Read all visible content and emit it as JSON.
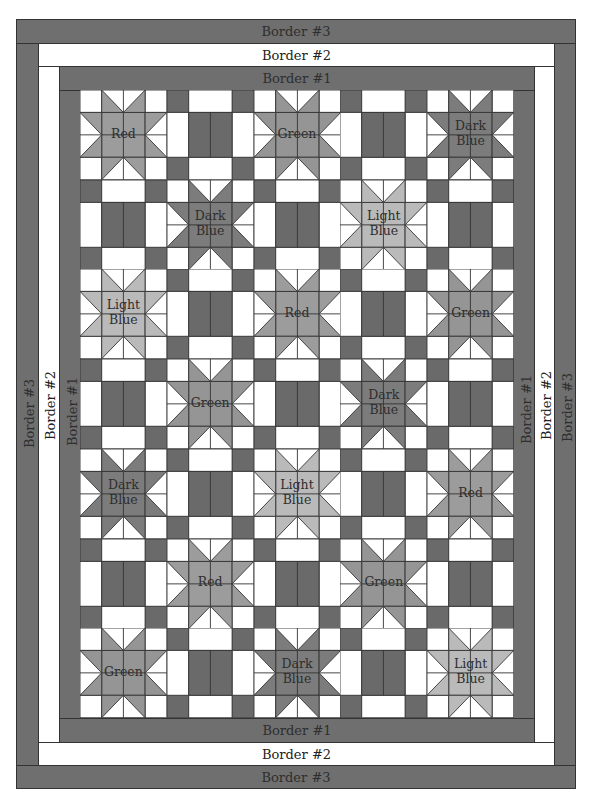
{
  "colors": {
    "border_dark": "#6f6f6f",
    "border_light": "#ffffff",
    "rail_dark": "#6a6a6a",
    "white": "#ffffff",
    "outline": "#333333",
    "star": {
      "Red": "#9c9c9c",
      "Green": "#959595",
      "Dark Blue": "#7c7c7c",
      "Light Blue": "#bababa"
    }
  },
  "borders": {
    "border3_label": "Border #3",
    "border2_label": "Border #2",
    "border1_label": "Border #1"
  },
  "grid": {
    "rows": [
      [
        {
          "type": "star",
          "color": "Red",
          "label": "Red"
        },
        {
          "type": "rail"
        },
        {
          "type": "star",
          "color": "Green",
          "label": "Green"
        },
        {
          "type": "rail"
        },
        {
          "type": "star",
          "color": "Dark Blue",
          "label": "Dark Blue"
        }
      ],
      [
        {
          "type": "rail"
        },
        {
          "type": "star",
          "color": "Dark Blue",
          "label": "Dark Blue"
        },
        {
          "type": "rail"
        },
        {
          "type": "star",
          "color": "Light Blue",
          "label": "Light Blue"
        },
        {
          "type": "rail"
        }
      ],
      [
        {
          "type": "star",
          "color": "Light Blue",
          "label": "Light Blue"
        },
        {
          "type": "rail"
        },
        {
          "type": "star",
          "color": "Red",
          "label": "Red"
        },
        {
          "type": "rail"
        },
        {
          "type": "star",
          "color": "Green",
          "label": "Green"
        }
      ],
      [
        {
          "type": "rail"
        },
        {
          "type": "star",
          "color": "Green",
          "label": "Green"
        },
        {
          "type": "rail"
        },
        {
          "type": "star",
          "color": "Dark Blue",
          "label": "Dark Blue"
        },
        {
          "type": "rail"
        }
      ],
      [
        {
          "type": "star",
          "color": "Dark Blue",
          "label": "Dark Blue"
        },
        {
          "type": "rail"
        },
        {
          "type": "star",
          "color": "Light Blue",
          "label": "Light Blue"
        },
        {
          "type": "rail"
        },
        {
          "type": "star",
          "color": "Red",
          "label": "Red"
        }
      ],
      [
        {
          "type": "rail"
        },
        {
          "type": "star",
          "color": "Red",
          "label": "Red"
        },
        {
          "type": "rail"
        },
        {
          "type": "star",
          "color": "Green",
          "label": "Green"
        },
        {
          "type": "rail"
        }
      ],
      [
        {
          "type": "star",
          "color": "Green",
          "label": "Green"
        },
        {
          "type": "rail"
        },
        {
          "type": "star",
          "color": "Dark Blue",
          "label": "Dark Blue"
        },
        {
          "type": "rail"
        },
        {
          "type": "star",
          "color": "Light Blue",
          "label": "Light Blue"
        }
      ]
    ]
  }
}
